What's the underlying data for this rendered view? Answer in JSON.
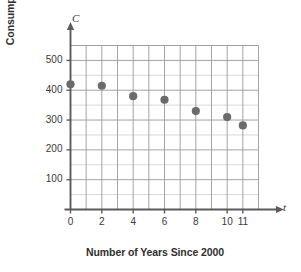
{
  "chart_data": {
    "type": "scatter",
    "title": "",
    "xlabel": "Number of Years Since 2000",
    "ylabel_line1": "Consumption of Cigarettes",
    "ylabel_line2": "(billions)",
    "x_axis_symbol": "t",
    "y_axis_symbol": "C",
    "x": [
      0,
      2,
      4,
      6,
      8,
      10,
      11
    ],
    "values": [
      420,
      415,
      380,
      368,
      330,
      310,
      282
    ],
    "points": [
      {
        "t": 0,
        "C": 420
      },
      {
        "t": 2,
        "C": 415
      },
      {
        "t": 4,
        "C": 380
      },
      {
        "t": 6,
        "C": 368
      },
      {
        "t": 8,
        "C": 330
      },
      {
        "t": 10,
        "C": 310
      },
      {
        "t": 11,
        "C": 282
      }
    ],
    "xlim": [
      0,
      12
    ],
    "ylim": [
      0,
      550
    ],
    "xticks": [
      0,
      2,
      4,
      6,
      8,
      10,
      11
    ],
    "xtick_labels": [
      "0",
      "2",
      "4",
      "6",
      "8",
      "10",
      "11"
    ],
    "yticks": [
      100,
      200,
      300,
      400,
      500
    ],
    "ytick_labels": [
      "100",
      "200",
      "300",
      "400",
      "500"
    ],
    "grid": true,
    "grid_major_y_step": 100,
    "grid_minor_y_step": 50,
    "grid_major_x_step": 1,
    "legend": "none",
    "marker_color": "#6b6b6b",
    "grid_color": "#9a9a9a",
    "minor_grid_color": "#c9c9c9",
    "axis_color": "#5a5a5a"
  }
}
